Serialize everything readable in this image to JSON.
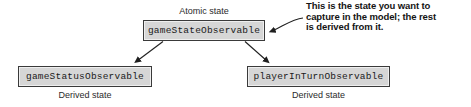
{
  "diagram": {
    "type": "state-dependency-graph",
    "nodes": {
      "atomic": {
        "label": "gameStateObservable",
        "caption": "Atomic state"
      },
      "derived_left": {
        "label": "gameStatusObservable",
        "caption": "Derived state"
      },
      "derived_right": {
        "label": "playerInTurnObservable",
        "caption": "Derived state"
      }
    },
    "annotation": {
      "line1": "This is the state you want to",
      "line2": "capture in the model; the rest",
      "line3": "is derived from it."
    },
    "colors": {
      "box_fill": "#d6d6d6",
      "box_border": "#3a3a3a",
      "text": "#1a1a1a",
      "connector": "#1f1f1f",
      "background": "#ffffff"
    }
  }
}
